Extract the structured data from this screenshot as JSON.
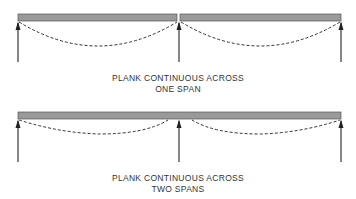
{
  "diagrams": [
    {
      "id": "one-span",
      "caption_line1": "PLANK CONTINUOUS ACROSS",
      "caption_line2": "ONE SPAN",
      "planks": [
        {
          "x1": 18,
          "x2": 177
        },
        {
          "x1": 180,
          "x2": 341
        }
      ],
      "supports_x": [
        18,
        179,
        341
      ],
      "deflection_curves": [
        {
          "x1": 19,
          "x2": 177,
          "sag": 24
        },
        {
          "x1": 181,
          "x2": 340,
          "sag": 24
        }
      ]
    },
    {
      "id": "two-spans",
      "caption_line1": "PLANK CONTINUOUS ACROSS",
      "caption_line2": "TWO SPANS",
      "planks": [
        {
          "x1": 18,
          "x2": 341
        }
      ],
      "supports_x": [
        18,
        179,
        341
      ],
      "deflection_curves": [
        {
          "x1": 19,
          "x2": 170,
          "sag": 14
        },
        {
          "x1": 190,
          "x2": 340,
          "sag": 14
        }
      ]
    }
  ],
  "colors": {
    "plank_fill": "#9a9a9a",
    "plank_stroke": "#555555",
    "line": "#222222"
  }
}
